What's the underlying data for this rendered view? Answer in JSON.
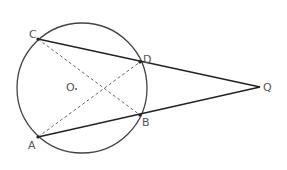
{
  "diagram": {
    "type": "geometry",
    "colors": {
      "stroke": "#222222",
      "circle": "#444444",
      "dashed": "#666666",
      "label": "#555555"
    },
    "circle": {
      "label": "O",
      "cx": 82,
      "cy": 88,
      "r": 65
    },
    "points": {
      "C": {
        "label": "C",
        "x": 38,
        "y": 39
      },
      "D": {
        "label": "D",
        "x": 140,
        "y": 62
      },
      "B": {
        "label": "B",
        "x": 140,
        "y": 115
      },
      "A": {
        "label": "A",
        "x": 38,
        "y": 137
      },
      "Q": {
        "label": "Q",
        "x": 260,
        "y": 87
      }
    },
    "solid_segments": [
      "CQ",
      "AQ"
    ],
    "dashed_segments": [
      "CB",
      "AD"
    ],
    "center_label": "O"
  }
}
